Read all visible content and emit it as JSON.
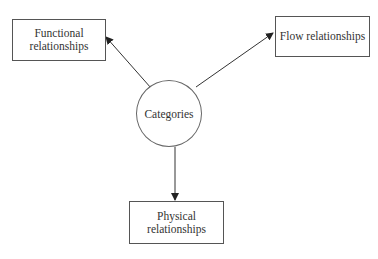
{
  "diagram": {
    "center": {
      "label": "Categories"
    },
    "nodes": [
      {
        "id": "functional",
        "label": "Functional relationships",
        "line1": "Functional",
        "line2": "relationships"
      },
      {
        "id": "flow",
        "label": "Flow relationships"
      },
      {
        "id": "physical",
        "label": "Physical relationships",
        "line1": "Physical",
        "line2": "relationships"
      }
    ],
    "edges": [
      {
        "from": "Categories",
        "to": "Functional relationships"
      },
      {
        "from": "Categories",
        "to": "Flow relationships"
      },
      {
        "from": "Categories",
        "to": "Physical relationships"
      }
    ]
  }
}
